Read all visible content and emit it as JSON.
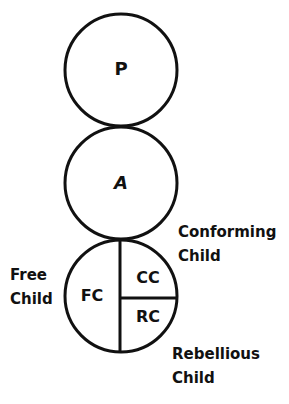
{
  "diagram": {
    "ego_states": [
      {
        "id": "parent",
        "label": "P"
      },
      {
        "id": "adult",
        "label": "A"
      }
    ],
    "child": {
      "segments": [
        {
          "id": "free-child",
          "label": "FC"
        },
        {
          "id": "conforming-child",
          "label": "CC"
        },
        {
          "id": "rebellious-child",
          "label": "RC"
        }
      ],
      "annotations": {
        "conforming": {
          "line1": "Conforming",
          "line2": "Child"
        },
        "free": {
          "line1": "Free",
          "line2": "Child"
        },
        "rebellious": {
          "line1": "Rebellious",
          "line2": "Child"
        }
      }
    },
    "colors": {
      "stroke": "#111111",
      "background": "#ffffff"
    }
  }
}
